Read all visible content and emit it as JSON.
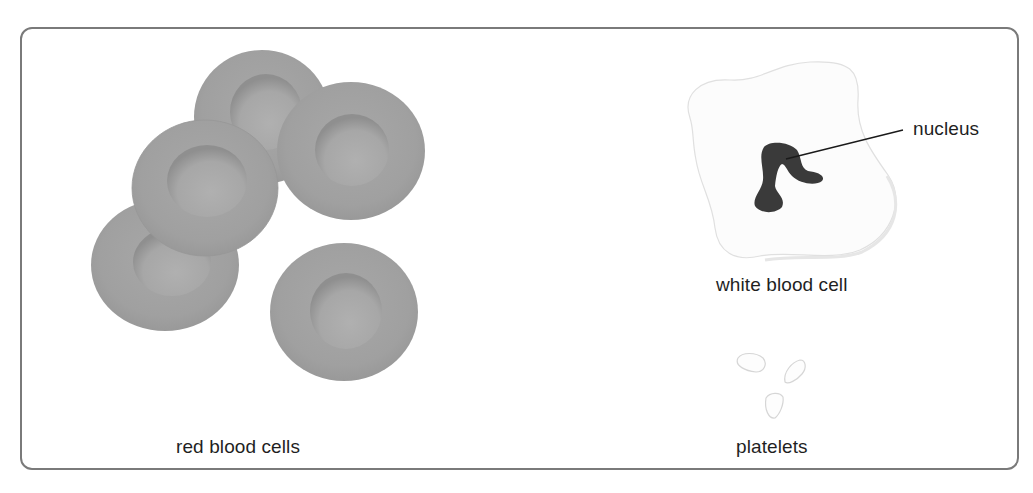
{
  "diagram": {
    "title": "",
    "labels": {
      "red_blood_cells": "red blood cells",
      "white_blood_cell": "white blood cell",
      "nucleus": "nucleus",
      "platelets": "platelets"
    },
    "colors": {
      "frame_border": "#7a7a7a",
      "rbc_fill": "#a0a0a0",
      "rbc_dimple": "#a9a9a9",
      "rbc_dimple_shadow": "#8e8e8e",
      "wbc_fill": "#fbfbfb",
      "wbc_outline": "#e2e2e2",
      "nucleus_fill": "#3a3a3a",
      "platelet_outline": "#d8d8d8",
      "text": "#1f1f1f"
    },
    "components": [
      {
        "name": "red blood cells",
        "count": 5
      },
      {
        "name": "white blood cell",
        "parts": [
          "nucleus"
        ]
      },
      {
        "name": "platelets",
        "count": 3
      }
    ]
  }
}
